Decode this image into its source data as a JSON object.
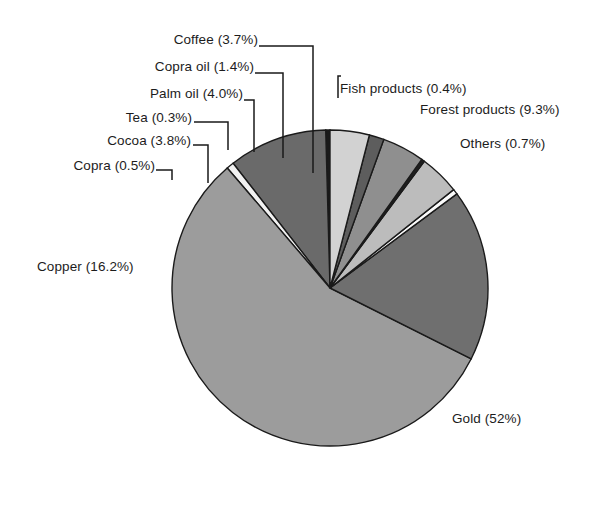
{
  "chart_data": {
    "type": "pie",
    "title": "",
    "subtitle": "",
    "xlabel": "",
    "ylabel": "",
    "grid": false,
    "legend_position": "callout-labels",
    "units": "percent",
    "total_percent": 92.3,
    "start_angle_deg": -90,
    "direction": "counter-clockwise",
    "center": {
      "x": 330,
      "y": 288
    },
    "radius": 158,
    "categories": [
      "Gold",
      "Copper",
      "Forest products",
      "Palm oil",
      "Cocoa",
      "Coffee",
      "Copra oil",
      "Others",
      "Copra",
      "Fish products",
      "Tea"
    ],
    "values": [
      52,
      16.2,
      9.3,
      4.0,
      3.8,
      3.7,
      1.4,
      0.7,
      0.5,
      0.4,
      0.3
    ],
    "slices": [
      {
        "name": "Fish products",
        "value": 0.4,
        "label": "Fish products (0.4%)",
        "color": "#1a1a1a"
      },
      {
        "name": "Forest products",
        "value": 9.3,
        "label": "Forest products (9.3%)",
        "color": "#6a6a6a"
      },
      {
        "name": "Others",
        "value": 0.7,
        "label": "Others (0.7%)",
        "color": "#f2f2f2"
      },
      {
        "name": "Gold",
        "value": 52,
        "label": "Gold (52%)",
        "color": "#9c9c9c"
      },
      {
        "name": "Copper",
        "value": 16.2,
        "label": "Copper (16.2%)",
        "color": "#6f6f6f"
      },
      {
        "name": "Copra",
        "value": 0.5,
        "label": "Copra (0.5%)",
        "color": "#fbfbfb"
      },
      {
        "name": "Cocoa",
        "value": 3.8,
        "label": "Cocoa (3.8%)",
        "color": "#bcbcbc"
      },
      {
        "name": "Tea",
        "value": 0.3,
        "label": "Tea (0.3%)",
        "color": "#1f1f1f"
      },
      {
        "name": "Palm oil",
        "value": 4.0,
        "label": "Palm oil (4.0%)",
        "color": "#8f8f8f"
      },
      {
        "name": "Copra oil",
        "value": 1.4,
        "label": "Copra oil (1.4%)",
        "color": "#5d5d5d"
      },
      {
        "name": "Coffee",
        "value": 3.7,
        "label": "Coffee (3.7%)",
        "color": "#d2d2d2"
      }
    ]
  },
  "labels": {
    "coffee": "Coffee (3.7%)",
    "copra_oil": "Copra oil (1.4%)",
    "palm_oil": "Palm oil (4.0%)",
    "tea": "Tea (0.3%)",
    "cocoa": "Cocoa (3.8%)",
    "copra": "Copra (0.5%)",
    "fish_products": "Fish products (0.4%)",
    "forest_products": "Forest products (9.3%)",
    "others": "Others (0.7%)",
    "copper": "Copper (16.2%)",
    "gold": "Gold (52%)"
  },
  "style": {
    "stroke_color": "#1a1a1a",
    "leader_color": "#1a1a1a",
    "text_color": "#1c1c1c",
    "background": "#ffffff"
  }
}
